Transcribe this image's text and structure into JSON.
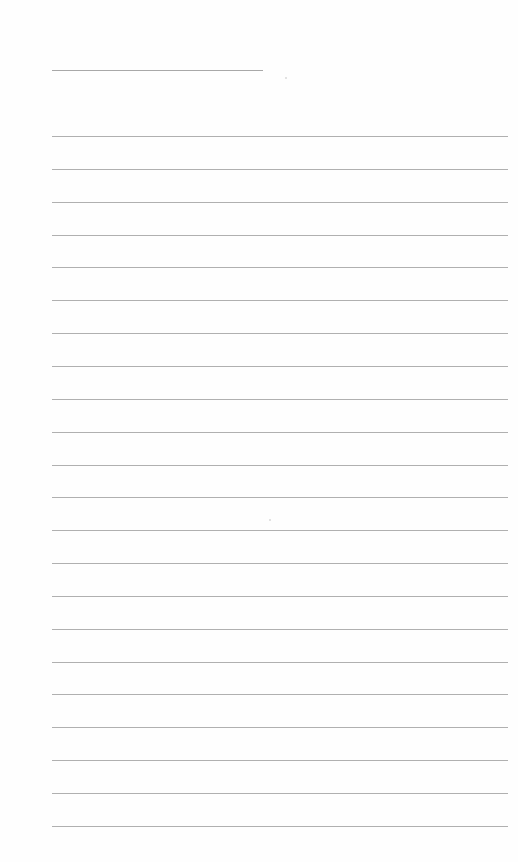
{
  "page": {
    "type": "blank lined notebook page",
    "background_color": "#fefefe",
    "line_color": "#b0b0b0",
    "title_line": {
      "x": 52,
      "y": 70,
      "width": 211
    },
    "ruled_lines": {
      "count": 22,
      "x": 52,
      "width": 456,
      "first_y": 136,
      "spacing": 32.85
    },
    "text": []
  }
}
